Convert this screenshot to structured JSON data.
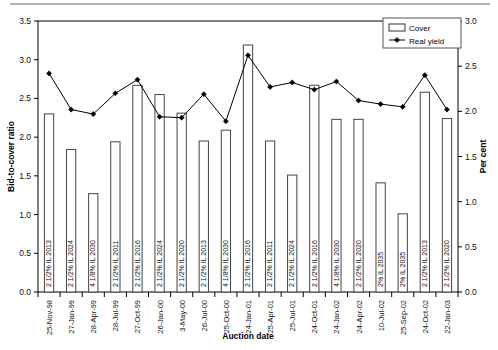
{
  "chart_data": {
    "type": "bar",
    "title": "",
    "xlabel": "Auction date",
    "ylabel": "Bid-to-cover ratio",
    "y2label": "Per cent",
    "ylim": [
      0.0,
      3.5
    ],
    "y2lim": [
      0.0,
      3.0
    ],
    "yticks": [
      "0.0",
      "0.5",
      "1.0",
      "1.5",
      "2.0",
      "2.5",
      "3.0",
      "3.5"
    ],
    "y2ticks": [
      "0.0",
      "0.5",
      "1.0",
      "1.5",
      "2.0",
      "2.5",
      "3.0"
    ],
    "grid": false,
    "legend_position": "top-right",
    "legend": [
      {
        "label": "Cover",
        "marker": "bar"
      },
      {
        "label": "Real yield",
        "marker": "line-diamond"
      }
    ],
    "categories": [
      "25-Nov-98",
      "27-Jan-99",
      "28-Apr-99",
      "28-Jul-99",
      "27-Oct-99",
      "26-Jan-00",
      "3-May-00",
      "26-Jul-00",
      "25-Oct-00",
      "24-Jan-01",
      "25-Apr-01",
      "25-Jul-01",
      "24-Oct-01",
      "24-Jan-02",
      "24-Apr-02",
      "10-Jul-02",
      "25-Sep-02",
      "24-Oct-02",
      "22-Jan-03"
    ],
    "bond_labels": [
      "2 1/2% IL 2013",
      "2 1/2% IL 2024",
      "4 1/8% IL 2030",
      "2 1/2% IL 2011",
      "2 1/2% IL 2016",
      "2 1/2% IL 2024",
      "2 1/2% IL 2020",
      "2 1/2% IL 2013",
      "4 1/8% IL 2030",
      "2 1/2% IL 2016",
      "2 1/2% IL 2011",
      "2 1/2% IL 2024",
      "2 1/2% IL 2016",
      "4 1/8% IL 2030",
      "2 1/2% IL 2020",
      "2% IL 2035",
      "2% IL 2035",
      "2 1/2% IL 2013",
      "2 1/2% IL 2020"
    ],
    "series": [
      {
        "name": "Cover",
        "axis": "left",
        "values": [
          2.3,
          1.84,
          1.27,
          1.94,
          2.67,
          2.55,
          2.31,
          1.95,
          2.09,
          3.19,
          1.95,
          1.51,
          2.67,
          2.23,
          2.23,
          1.41,
          1.01,
          2.58,
          2.24
        ]
      },
      {
        "name": "Real yield",
        "axis": "right",
        "values": [
          2.42,
          2.02,
          1.97,
          2.2,
          2.35,
          1.94,
          1.93,
          2.19,
          1.89,
          2.62,
          2.27,
          2.32,
          2.24,
          2.33,
          2.12,
          2.08,
          2.05,
          2.4,
          2.02
        ]
      }
    ]
  }
}
